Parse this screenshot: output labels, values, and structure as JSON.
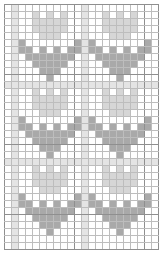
{
  "chart": {
    "type": "knitting-colorwork-chart",
    "cell_size": 7,
    "columns": 22,
    "rows": 35,
    "major_every": 10,
    "colors": {
      "background": "#ffffff",
      "grid_line": "#bdbdbd",
      "grid_major": "#8f8f8f",
      "band": "#e4e4e4",
      "flower_head": "#d6d6d6",
      "leaves_stem": "#a9a9a9"
    },
    "bands": {
      "columns": [
        1,
        11
      ],
      "rows": [
        11,
        22
      ]
    },
    "motif": {
      "name": "tulip",
      "width": 9,
      "height": 10,
      "pixels": [
        "..1.1.1..",
        "..11111..",
        "..11111..",
        "...111...",
        "2.......2",
        "22.2.2.22",
        ".2222222.",
        "..22222..",
        "...222...",
        "....2...."
      ]
    },
    "placements": [
      {
        "col": 2,
        "row": 1
      },
      {
        "col": 12,
        "row": 1
      },
      {
        "col": 2,
        "row": 12
      },
      {
        "col": 12,
        "row": 12
      },
      {
        "col": 2,
        "row": 23
      },
      {
        "col": 12,
        "row": 23
      }
    ]
  }
}
